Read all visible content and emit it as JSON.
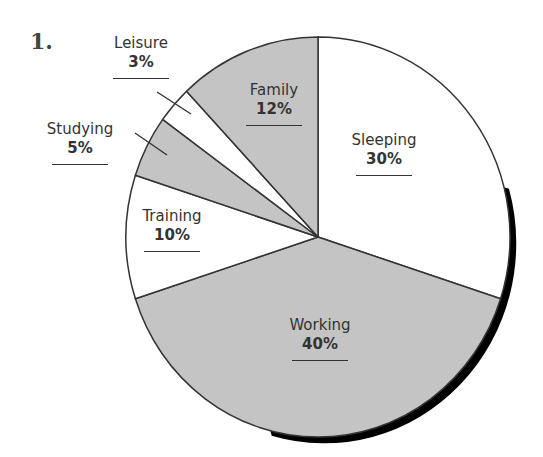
{
  "question_number": "1.",
  "colors": {
    "shaded": "#c4c4c4",
    "unshaded": "#ffffff",
    "outline": "#333333",
    "shadow": "#000000"
  },
  "chart_data": {
    "type": "pie",
    "title": "",
    "start_angle_deg": 0,
    "direction": "clockwise from 12 o'clock",
    "slices": [
      {
        "label": "Sleeping",
        "value": 30,
        "display": "30%",
        "shaded": false
      },
      {
        "label": "Working",
        "value": 40,
        "display": "40%",
        "shaded": true
      },
      {
        "label": "Training",
        "value": 10,
        "display": "10%",
        "shaded": false
      },
      {
        "label": "Studying",
        "value": 5,
        "display": "5%",
        "shaded": true
      },
      {
        "label": "Leisure",
        "value": 3,
        "display": "3%",
        "shaded": false
      },
      {
        "label": "Family",
        "value": 12,
        "display": "12%",
        "shaded": true
      }
    ]
  },
  "labels": {
    "sleeping": {
      "name": "Sleeping",
      "pct": "30%"
    },
    "working": {
      "name": "Working",
      "pct": "40%"
    },
    "training": {
      "name": "Training",
      "pct": "10%"
    },
    "studying": {
      "name": "Studying",
      "pct": "5%"
    },
    "leisure": {
      "name": "Leisure",
      "pct": "3%"
    },
    "family": {
      "name": "Family",
      "pct": "12%"
    }
  }
}
